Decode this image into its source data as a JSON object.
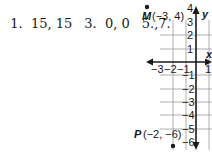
{
  "answers": [
    {
      "number": "1.",
      "value": "15, 15"
    },
    {
      "number": "3.",
      "value": "0, 0"
    },
    {
      "number": "5.,",
      "value": "7."
    }
  ],
  "answers_text": [
    "1.  15, 15",
    "3.  0, 0",
    "5.,7."
  ],
  "graph": {
    "x_axis_label": "x",
    "y_axis_label": "y",
    "x_tick_labels": [
      "-3",
      "-2",
      "-1",
      "1"
    ],
    "y_tick_labels": [
      "4",
      "3",
      "2",
      "1",
      "-1",
      "-2",
      "-3",
      "-4",
      "-5",
      "-6"
    ],
    "points": [
      {
        "name": "M",
        "coords": "(-3, 4)",
        "x": -3,
        "y": 4
      },
      {
        "name": "P",
        "coords": "(-2, -6)",
        "x": -2,
        "y": -6
      }
    ]
  }
}
